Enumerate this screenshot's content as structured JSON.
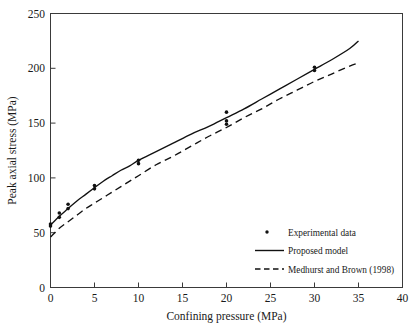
{
  "chart_data": {
    "type": "scatter",
    "title": "",
    "xlabel": "Confining pressure (MPa)",
    "ylabel": "Peak axial stress (MPa)",
    "xlim": [
      0,
      40
    ],
    "ylim": [
      0,
      250
    ],
    "xticks": [
      0,
      5,
      10,
      15,
      20,
      25,
      30,
      35,
      40
    ],
    "yticks": [
      0,
      50,
      100,
      150,
      200,
      250
    ],
    "xtick_labels": [
      "0",
      "5",
      "10",
      "15",
      "20",
      "25",
      "30",
      "35",
      "40"
    ],
    "ytick_labels": [
      "0",
      "50",
      "100",
      "150",
      "200",
      "250"
    ],
    "grid": false,
    "legend_position": "lower right",
    "series": [
      {
        "name": "Experimental data",
        "type": "scatter",
        "marker": "dot",
        "points": [
          {
            "x": 0,
            "y": 56
          },
          {
            "x": 0,
            "y": 58
          },
          {
            "x": 1,
            "y": 64
          },
          {
            "x": 1,
            "y": 68
          },
          {
            "x": 2,
            "y": 72
          },
          {
            "x": 2,
            "y": 76
          },
          {
            "x": 5,
            "y": 90
          },
          {
            "x": 5,
            "y": 93
          },
          {
            "x": 10,
            "y": 113
          },
          {
            "x": 10,
            "y": 116
          },
          {
            "x": 20,
            "y": 149
          },
          {
            "x": 20,
            "y": 152
          },
          {
            "x": 20,
            "y": 160
          },
          {
            "x": 30,
            "y": 198
          },
          {
            "x": 30,
            "y": 201
          }
        ]
      },
      {
        "name": "Proposed model",
        "type": "line",
        "style": "solid",
        "x": [
          0,
          1,
          2,
          3,
          4,
          5,
          6,
          7,
          8,
          9,
          10,
          12,
          14,
          16,
          18,
          20,
          22,
          24,
          26,
          28,
          30,
          32,
          34,
          35
        ],
        "y": [
          57,
          65,
          72,
          79,
          85,
          91,
          97,
          102,
          107,
          111,
          116,
          124,
          132,
          140,
          147,
          155,
          163,
          172,
          181,
          190,
          199,
          208,
          218,
          225
        ]
      },
      {
        "name": "Medhurst and Brown (1998)",
        "type": "line",
        "style": "dashed",
        "x": [
          0,
          1,
          2,
          3,
          4,
          5,
          6,
          7,
          8,
          9,
          10,
          12,
          14,
          16,
          18,
          20,
          22,
          24,
          26,
          28,
          30,
          32,
          34,
          35
        ],
        "y": [
          46,
          54,
          60,
          66,
          72,
          77,
          82,
          87,
          92,
          97,
          102,
          112,
          120,
          129,
          138,
          146,
          155,
          163,
          172,
          180,
          188,
          195,
          202,
          205
        ]
      }
    ]
  },
  "legend": {
    "entries": [
      {
        "label": "Experimental data",
        "marker": "dot"
      },
      {
        "label": "Proposed model",
        "marker": "solid-line"
      },
      {
        "label": "Medhurst and Brown (1998)",
        "marker": "dashed-line"
      }
    ]
  },
  "colors": {
    "line": "#111111",
    "frame": "#3a3a3a",
    "background": "#ffffff",
    "text": "#1a1a1a"
  }
}
